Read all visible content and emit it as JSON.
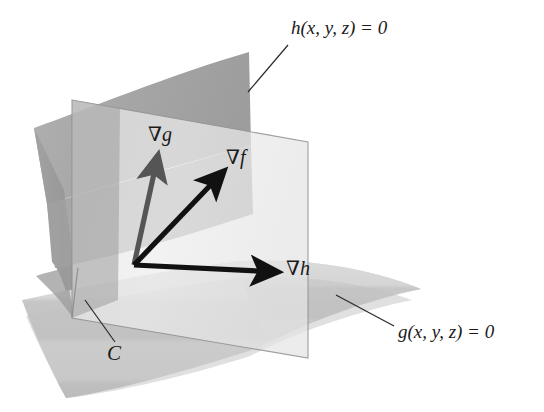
{
  "figure": {
    "background_color": "#ffffff",
    "width": 544,
    "height": 412
  },
  "labels": {
    "surface_h": "h(x, y, z) = 0",
    "surface_g": "g(x, y, z) = 0",
    "gradient_f": "∇f",
    "gradient_g": "∇g",
    "gradient_h": "∇h",
    "curve_c": "C"
  },
  "colors": {
    "background": "#ffffff",
    "surface_h": "#a8a8a8",
    "surface_h_dark": "#949494",
    "surface_g_light": "#dcdcdc",
    "surface_g_mid": "#c9c9c9",
    "surface_g_dark": "#bdbdbd",
    "plane_fill": "#eeeeee",
    "plane_edge": "#8f8f8f",
    "overlap_dark": "#999999",
    "arrow_black": "#111111",
    "arrow_gray": "#555555",
    "leader_line": "#2a2a2a",
    "text": "#1a1a1a"
  },
  "geometry": {
    "vector_origin": {
      "x": 134,
      "y": 265
    },
    "vectors": [
      {
        "name": "gradient-g",
        "tip_x": 158,
        "tip_y": 152,
        "color": "#555555"
      },
      {
        "name": "gradient-f",
        "tip_x": 225,
        "tip_y": 168,
        "color": "#111111"
      },
      {
        "name": "gradient-h",
        "tip_x": 280,
        "tip_y": 272,
        "color": "#111111"
      }
    ],
    "leader_lines": [
      {
        "name": "leader-h",
        "x1": 286,
        "y1": 44,
        "x2": 248,
        "y2": 90
      },
      {
        "name": "leader-g",
        "x1": 393,
        "y1": 327,
        "x2": 338,
        "y2": 295
      },
      {
        "name": "leader-c",
        "x1": 114,
        "y1": 341,
        "x2": 84,
        "y2": 300
      }
    ]
  }
}
